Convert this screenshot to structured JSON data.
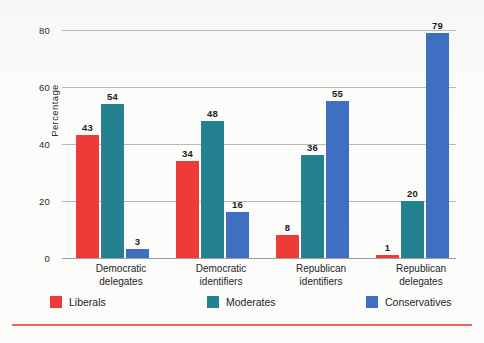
{
  "chart_data": {
    "type": "bar",
    "title": "",
    "subtitle": "",
    "xlabel": "",
    "ylabel": "Percentage",
    "ylim": [
      0,
      80
    ],
    "yticks": [
      0,
      20,
      40,
      60,
      80
    ],
    "grid": true,
    "legend_position": "bottom",
    "categories": [
      "Democratic delegates",
      "Democratic identifiers",
      "Republican identifiers",
      "Republican delegates"
    ],
    "category_lines": [
      [
        "Democratic",
        "delegates"
      ],
      [
        "Democratic",
        "identifiers"
      ],
      [
        "Republican",
        "identifiers"
      ],
      [
        "Republican",
        "delegates"
      ]
    ],
    "series": [
      {
        "name": "Liberals",
        "color": "#ee3b38",
        "values": [
          43,
          34,
          8,
          1
        ]
      },
      {
        "name": "Moderates",
        "color": "#238190",
        "values": [
          54,
          48,
          36,
          20
        ]
      },
      {
        "name": "Conservatives",
        "color": "#3f6fc0",
        "values": [
          3,
          16,
          55,
          79
        ]
      }
    ]
  },
  "axis": {
    "y_label": "Percentage",
    "y_tick_labels": [
      "80",
      "60",
      "40",
      "20",
      "0"
    ]
  },
  "legend": {
    "items": [
      {
        "label": "Liberals",
        "color": "#ee3b38"
      },
      {
        "label": "Moderates",
        "color": "#238190"
      },
      {
        "label": "Conservatives",
        "color": "#3f6fc0"
      }
    ]
  },
  "colors": {
    "liberals": "#ee3b38",
    "moderates": "#238190",
    "conservatives": "#3f6fc0",
    "rule": "#e4685f",
    "gridline": "#b9b9b9",
    "background": "#fbfbfa"
  }
}
